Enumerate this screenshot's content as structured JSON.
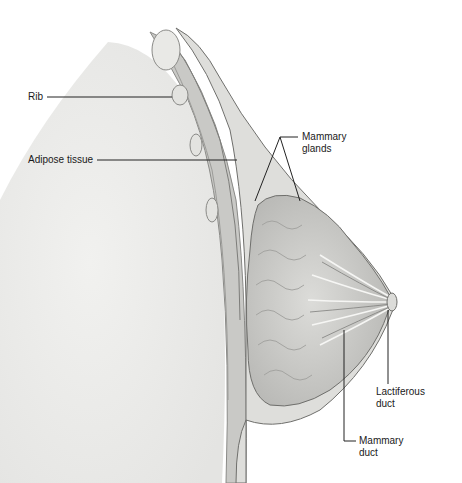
{
  "diagram": {
    "colors": {
      "background": "#ffffff",
      "chest_wall": "#eeeeec",
      "tissue": "#d9d9d6",
      "gland": "#c8c8c5",
      "line": "#333333",
      "label": "#1a1a1a"
    },
    "labels": [
      {
        "id": "rib",
        "text": "Rib",
        "x": 28,
        "y": 92
      },
      {
        "id": "adipose",
        "text": "Adipose tissue",
        "x": 28,
        "y": 154
      },
      {
        "id": "mammary-glands",
        "text": "Mammary\nglands",
        "x": 302,
        "y": 135
      },
      {
        "id": "lactiferous-duct",
        "text": "Lactiferous\nduct",
        "x": 376,
        "y": 389
      },
      {
        "id": "mammary-duct",
        "text": "Mammary\nduct",
        "x": 360,
        "y": 436
      }
    ]
  }
}
